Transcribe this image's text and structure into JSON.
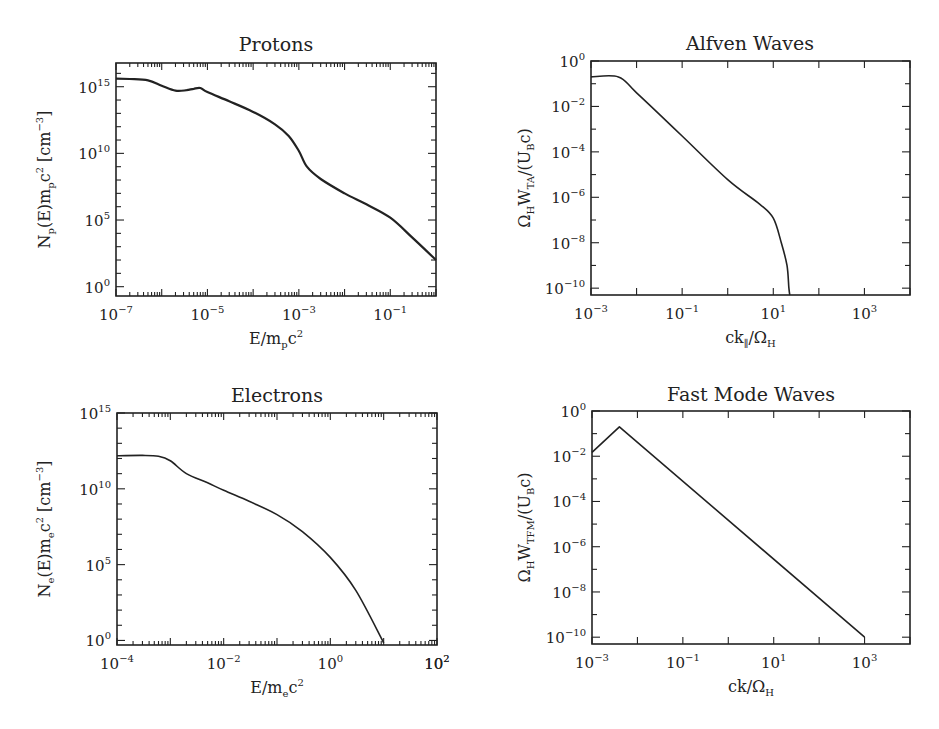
{
  "figure": {
    "panels": [
      {
        "id": "protons",
        "title": "Protons",
        "xlabel": "E/m_p c^2",
        "ylabel": "N_p(E) m_p c^2 [cm^-3]"
      },
      {
        "id": "alfven",
        "title": "Alfven Waves",
        "xlabel": "ck_∥/Ω_H",
        "ylabel": "Ω_H W_TA/(U_B c)"
      },
      {
        "id": "electrons",
        "title": "Electrons",
        "xlabel": "E/m_e c^2",
        "ylabel": "N_e(E) m_e c^2 [cm^-3]"
      },
      {
        "id": "fastmode",
        "title": "Fast Mode Waves",
        "xlabel": "ck/Ω_H",
        "ylabel": "Ω_H W_TFM/(U_B c)"
      }
    ]
  },
  "chart_data": [
    {
      "type": "line",
      "title": "Protons",
      "xlabel": "E/m_pc^2",
      "ylabel": "N_p(E)m_pc^2 [cm^-3]",
      "xscale": "log",
      "yscale": "log",
      "xlim": [
        1e-07,
        1
      ],
      "ylim": [
        0.2,
        6e+16
      ],
      "xticks": [
        "10^-7",
        "10^-5",
        "10^-3",
        "10^-1"
      ],
      "xtick_values": [
        1e-07,
        1e-05,
        0.001,
        0.1
      ],
      "yticks": [
        "10^0",
        "10^5",
        "10^10",
        "10^15"
      ],
      "ytick_values": [
        1,
        100000.0,
        10000000000.0,
        1000000000000000.0
      ],
      "grid": false,
      "series": [
        {
          "name": "protons",
          "x": [
            1e-07,
            2e-07,
            5e-07,
            1e-06,
            2e-06,
            3.5e-06,
            5e-06,
            7e-06,
            1e-05,
            3e-05,
            0.0001,
            0.0003,
            0.0006,
            0.001,
            0.0015,
            0.003,
            0.01,
            0.03,
            0.1,
            0.3,
            1
          ],
          "y": [
            4000000000000000.0,
            3800000000000000.0,
            3000000000000000.0,
            1200000000000000.0,
            500000000000000.0,
            550000000000000.0,
            700000000000000.0,
            800000000000000.0,
            400000000000000.0,
            80000000000000.0,
            13000000000000.0,
            1500000000000.0,
            200000000000.0,
            15000000000.0,
            1000000000.0,
            120000000.0,
            10000000.0,
            1500000.0,
            150000.0,
            5000.0,
            100.0
          ]
        }
      ]
    },
    {
      "type": "line",
      "title": "Alfven Waves",
      "xlabel": "ck_∥/Ω_H",
      "ylabel": "Ω_H W_TA/(U_B c)",
      "xscale": "log",
      "yscale": "log",
      "xlim": [
        0.001,
        10000.0
      ],
      "ylim": [
        5e-11,
        1
      ],
      "xticks": [
        "10^-3",
        "10^-1",
        "10^1",
        "10^3"
      ],
      "xtick_values": [
        0.001,
        0.1,
        10,
        1000
      ],
      "yticks": [
        "10^0",
        "10^-2",
        "10^-4",
        "10^-6",
        "10^-8",
        "10^-10"
      ],
      "ytick_values": [
        1,
        0.01,
        0.0001,
        1e-06,
        1e-08,
        1e-10
      ],
      "grid": false,
      "series": [
        {
          "name": "alfven",
          "x": [
            0.001,
            0.004,
            0.01,
            0.1,
            1,
            5,
            10,
            15,
            20,
            22,
            23
          ],
          "y": [
            0.2,
            0.2,
            0.04,
            0.0005,
            6e-06,
            5e-07,
            1.2e-07,
            1e-08,
            1e-09,
            1e-10,
            5e-11
          ]
        }
      ]
    },
    {
      "type": "line",
      "title": "Electrons",
      "xlabel": "E/m_ec^2",
      "ylabel": "N_e(E)m_ec^2 [cm^-3]",
      "xscale": "log",
      "yscale": "log",
      "xlim": [
        0.0001,
        100
      ],
      "ylim": [
        0.5,
        1000000000000000.0
      ],
      "xticks": [
        "10^-4",
        "10^-2",
        "10^0",
        "10^2"
      ],
      "xtick_values": [
        0.0001,
        0.01,
        1,
        100
      ],
      "yticks": [
        "10^0",
        "10^5",
        "10^10",
        "10^15"
      ],
      "ytick_values": [
        1,
        100000.0,
        10000000000.0,
        1000000000000000.0
      ],
      "grid": false,
      "series": [
        {
          "name": "electrons",
          "x": [
            0.0001,
            0.0003,
            0.0006,
            0.001,
            0.002,
            0.005,
            0.01,
            0.03,
            0.1,
            0.3,
            1,
            3,
            10
          ],
          "y": [
            1500000000000.0,
            1600000000000.0,
            1400000000000.0,
            700000000000.0,
            100000000000.0,
            25000000000.0,
            8000000000.0,
            1500000000.0,
            200000000.0,
            15000000.0,
            300000.0,
            2000.0,
            0.7
          ]
        }
      ]
    },
    {
      "type": "line",
      "title": "Fast Mode Waves",
      "xlabel": "ck/Ω_H",
      "ylabel": "Ω_H W_TFM/(U_B c)",
      "xscale": "log",
      "yscale": "log",
      "xlim": [
        0.001,
        10000.0
      ],
      "ylim": [
        5e-11,
        1
      ],
      "xticks": [
        "10^-3",
        "10^-1",
        "10^1",
        "10^3"
      ],
      "xtick_values": [
        0.001,
        0.1,
        10,
        1000
      ],
      "yticks": [
        "10^0",
        "10^-2",
        "10^-4",
        "10^-6",
        "10^-8",
        "10^-10"
      ],
      "ytick_values": [
        1,
        0.01,
        0.0001,
        1e-06,
        1e-08,
        1e-10
      ],
      "grid": false,
      "series": [
        {
          "name": "fast-mode",
          "x": [
            0.001,
            0.004,
            1000
          ],
          "y": [
            0.015,
            0.2,
            1e-10
          ]
        }
      ]
    }
  ]
}
